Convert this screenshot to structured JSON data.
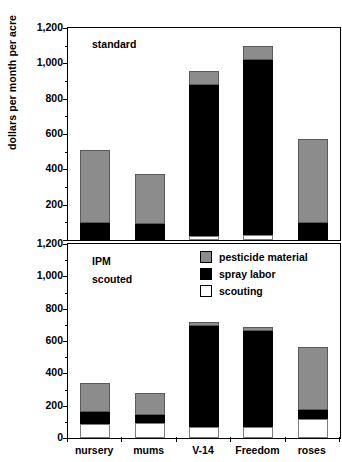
{
  "chart_data": {
    "type": "bar",
    "title": "",
    "xlabel": "",
    "ylabel": "dollars per month per acre",
    "ylim": [
      0,
      1200
    ],
    "yticks": [
      0,
      200,
      400,
      600,
      800,
      1000,
      1200
    ],
    "ytick_labels": [
      "0",
      "200",
      "400",
      "600",
      "800",
      "1,000",
      "1,200"
    ],
    "minor_tick_step": 100,
    "grid": false,
    "stacked": true,
    "legend_position": "upper-right of lower panel",
    "categories": [
      "nursery",
      "mums",
      "V-14",
      "Freedom",
      "roses"
    ],
    "legend": [
      "pesticide material",
      "spray labor",
      "scouting"
    ],
    "series_colors": {
      "pesticide material": "#8c8c8c",
      "spray labor": "#000000",
      "scouting": "#ffffff"
    },
    "panels": [
      {
        "name": "standard",
        "annotation": "standard",
        "series": [
          {
            "name": "scouting",
            "values": [
              0,
              0,
              20,
              30,
              0
            ]
          },
          {
            "name": "spray labor",
            "values": [
              95,
              90,
              860,
              990,
              95
            ]
          },
          {
            "name": "pesticide material",
            "values": [
              415,
              285,
              75,
              80,
              475
            ]
          }
        ],
        "totals": [
          510,
          375,
          955,
          1100,
          570
        ]
      },
      {
        "name": "IPM scouted",
        "annotation": "IPM scouted",
        "annotation_lines": [
          "IPM",
          "scouted"
        ],
        "series": [
          {
            "name": "scouting",
            "values": [
              85,
              90,
              70,
              70,
              115
            ]
          },
          {
            "name": "spray labor",
            "values": [
              75,
              55,
              620,
              590,
              60
            ]
          },
          {
            "name": "pesticide material",
            "values": [
              180,
              135,
              30,
              25,
              385
            ]
          }
        ],
        "totals": [
          340,
          280,
          720,
          685,
          560
        ]
      }
    ]
  },
  "axis": {
    "y_title": "dollars per month per acre",
    "tick_labels": [
      "1,200",
      "1,000",
      "800",
      "600",
      "400",
      "200",
      "0"
    ]
  },
  "panel_top": {
    "annotation": "standard"
  },
  "panel_bottom": {
    "annotation_line1": "IPM",
    "annotation_line2": "scouted"
  },
  "legend": {
    "items": [
      {
        "label": "pesticide material",
        "swatch": "gray"
      },
      {
        "label": "spray labor",
        "swatch": "black"
      },
      {
        "label": "scouting",
        "swatch": "white"
      }
    ]
  },
  "x_labels": [
    "nursery",
    "mums",
    "V-14",
    "Freedom",
    "roses"
  ]
}
